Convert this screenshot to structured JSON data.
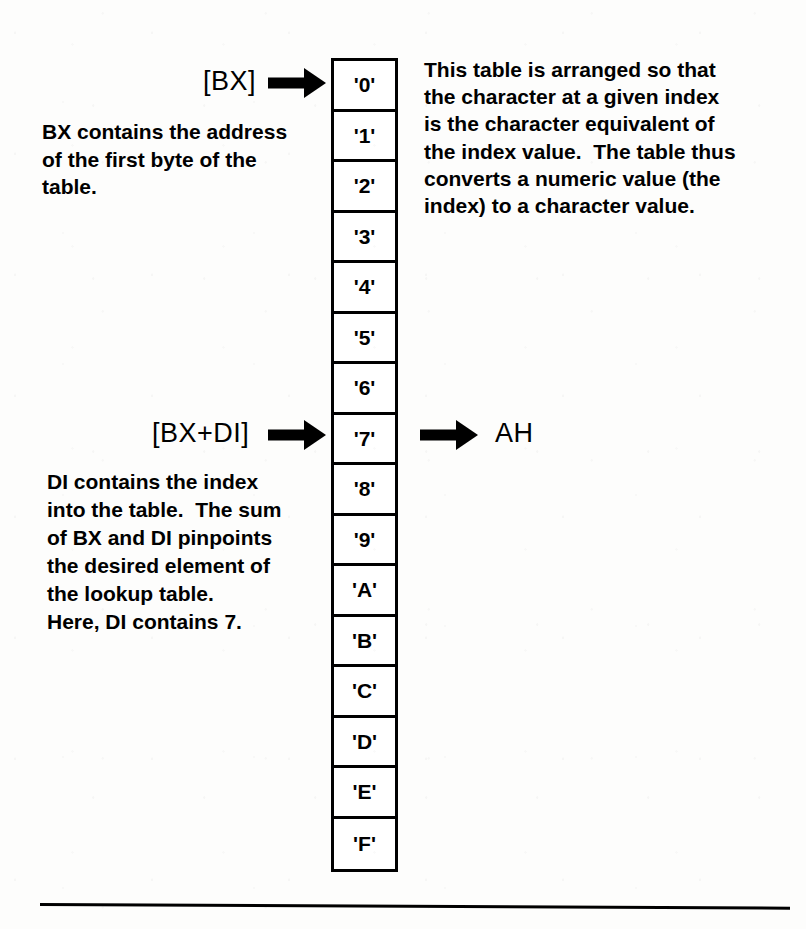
{
  "diagram": {
    "ink_color": "#000000",
    "paper_color": "#fdfdfc"
  },
  "table": {
    "name": "lookup-table",
    "cell_count": 16,
    "cells": [
      {
        "index": 0,
        "label": "'0'"
      },
      {
        "index": 1,
        "label": "'1'"
      },
      {
        "index": 2,
        "label": "'2'"
      },
      {
        "index": 3,
        "label": "'3'"
      },
      {
        "index": 4,
        "label": "'4'"
      },
      {
        "index": 5,
        "label": "'5'"
      },
      {
        "index": 6,
        "label": "'6'"
      },
      {
        "index": 7,
        "label": "'7'"
      },
      {
        "index": 8,
        "label": "'8'"
      },
      {
        "index": 9,
        "label": "'9'"
      },
      {
        "index": 10,
        "label": "'A'"
      },
      {
        "index": 11,
        "label": "'B'"
      },
      {
        "index": 12,
        "label": "'C'"
      },
      {
        "index": 13,
        "label": "'D'"
      },
      {
        "index": 14,
        "label": "'E'"
      },
      {
        "index": 15,
        "label": "'F'"
      }
    ]
  },
  "pointers": {
    "base": {
      "label": "[BX]",
      "target_cell_index": 0,
      "arrow": "right-arrow-icon"
    },
    "indexed": {
      "label": "[BX+DI]",
      "target_cell_index": 7,
      "arrow": "right-arrow-icon"
    },
    "destination": {
      "label": "AH",
      "source_cell_index": 7,
      "arrow": "right-arrow-icon"
    }
  },
  "annotations": {
    "bx_description": "BX contains the address\nof the first byte of the\ntable.",
    "di_description": "DI contains the index\ninto the table.  The sum\nof BX and DI pinpoints\nthe desired element of\nthe lookup table.\nHere, DI contains 7.",
    "table_description": "This table is arranged so that\nthe character at a given index\nis the character equivalent of\nthe index value.  The table thus\nconverts a numeric value (the\nindex) to a character value."
  }
}
